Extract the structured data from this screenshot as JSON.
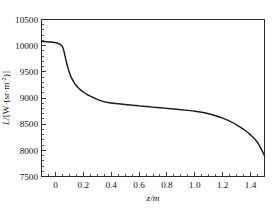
{
  "chart_data": {
    "type": "line",
    "title": "",
    "subtitle": "",
    "xlabel": "z/m",
    "ylabel": "L/[W·(sr·m⁻²)]",
    "ylabel_parts": {
      "symbol": "L",
      "slash": "/[",
      "unit": "W·(sr·m",
      "exponent": "-2",
      "close": ")]"
    },
    "xlim": [
      -0.1,
      1.5
    ],
    "ylim": [
      7500,
      10500
    ],
    "x_ticks": [
      0,
      0.2,
      0.4,
      0.6,
      0.8,
      1.0,
      1.2,
      1.4
    ],
    "x_tick_labels": [
      "0",
      "0.2",
      "0.4",
      "0.6",
      "0.8",
      "1.0",
      "1.2",
      "1.4"
    ],
    "x_minor_step": 0.05,
    "y_ticks": [
      7500,
      8000,
      8500,
      9000,
      9500,
      10000,
      10500
    ],
    "y_tick_labels": [
      "7500",
      "8000",
      "8500",
      "9000",
      "9500",
      "10000",
      "10500"
    ],
    "y_minor_step": 100,
    "grid": false,
    "legend": null,
    "line_color": "#1c1c1c",
    "frame_color": "#2b2b2b",
    "background_color": "#ffffff",
    "series": [
      {
        "name": "radiance",
        "x": [
          -0.1,
          -0.06,
          -0.02,
          0.01,
          0.03,
          0.045,
          0.055,
          0.065,
          0.075,
          0.09,
          0.105,
          0.12,
          0.14,
          0.16,
          0.18,
          0.2,
          0.225,
          0.25,
          0.275,
          0.3,
          0.33,
          0.36,
          0.37,
          0.4,
          0.45,
          0.5,
          0.55,
          0.6,
          0.65,
          0.7,
          0.75,
          0.8,
          0.85,
          0.9,
          0.95,
          1.0,
          1.05,
          1.1,
          1.15,
          1.2,
          1.25,
          1.3,
          1.35,
          1.4,
          1.45,
          1.5
        ],
        "y": [
          10080,
          10075,
          10065,
          10050,
          10030,
          10000,
          9950,
          9850,
          9730,
          9570,
          9450,
          9360,
          9270,
          9205,
          9155,
          9115,
          9070,
          9035,
          9005,
          8975,
          8945,
          8922,
          8918,
          8905,
          8890,
          8875,
          8862,
          8850,
          8838,
          8826,
          8814,
          8802,
          8790,
          8777,
          8763,
          8748,
          8728,
          8700,
          8662,
          8615,
          8558,
          8488,
          8400,
          8295,
          8150,
          7900
        ]
      }
    ]
  }
}
